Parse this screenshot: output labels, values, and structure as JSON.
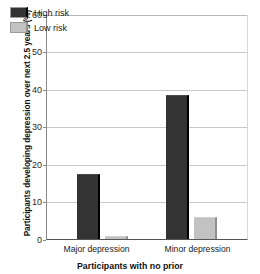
{
  "chart_data": {
    "type": "bar",
    "title": "",
    "categories": [
      "Major depression",
      "Minor depression"
    ],
    "series": [
      {
        "name": "High risk",
        "values": [
          17.5,
          38.5
        ],
        "color": "#333333"
      },
      {
        "name": "Low risk",
        "values": [
          0.8,
          6.0
        ],
        "color": "#c2c2c2"
      }
    ],
    "xlabel": "Participants with no prior",
    "ylabel": "Participants developing depression over next 2.5 years (%)",
    "ylim": [
      0,
      60
    ],
    "yticks": [
      0,
      10,
      20,
      30,
      40,
      50,
      60
    ],
    "ytick_labels": [
      "0",
      "10",
      "20",
      "30",
      "40",
      "50",
      "60"
    ],
    "grid": true,
    "legend_position": "top-left"
  },
  "legend": {
    "items": [
      {
        "label": "High risk",
        "swatch": "dark-swatch"
      },
      {
        "label": "Low risk",
        "swatch": "light-swatch"
      }
    ]
  }
}
